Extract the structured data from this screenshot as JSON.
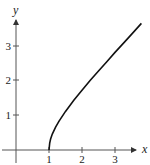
{
  "chart_data": {
    "type": "line",
    "title": "",
    "xlabel": "x",
    "ylabel": "y",
    "xlim": [
      -0.5,
      4.0
    ],
    "ylim": [
      -0.5,
      3.9
    ],
    "grid": false,
    "legend": null,
    "x_ticks": [
      "1",
      "2",
      "3"
    ],
    "y_ticks": [
      "1",
      "2",
      "3"
    ],
    "series": [
      {
        "name": "y = sqrt(x^2 - 1)",
        "x": [
          1.0,
          1.02,
          1.05,
          1.1,
          1.2,
          1.3,
          1.5,
          1.75,
          2.0,
          2.25,
          2.5,
          2.75,
          3.0,
          3.25,
          3.5,
          3.8
        ],
        "y": [
          0.0,
          0.2,
          0.32,
          0.46,
          0.66,
          0.83,
          1.12,
          1.44,
          1.73,
          2.02,
          2.29,
          2.56,
          2.83,
          3.09,
          3.35,
          3.67
        ]
      }
    ]
  },
  "axes": {
    "x_label": "x",
    "y_label": "y",
    "x_tick_labels": [
      "1",
      "2",
      "3"
    ],
    "y_tick_labels": [
      "1",
      "2",
      "3"
    ]
  }
}
